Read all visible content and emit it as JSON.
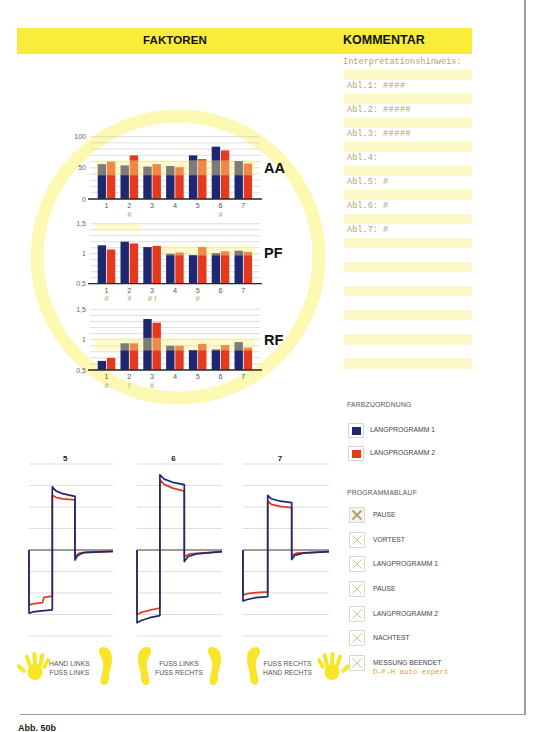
{
  "header": {
    "faktoren": "FAKTOREN",
    "kommentar": "KOMMENTAR",
    "accent_color": "#f9ec3a"
  },
  "kommentar": {
    "interpretation": "Interpretationshinweis:",
    "rows": [
      {
        "label": "Abl.1:",
        "value": "####"
      },
      {
        "label": "Abl.2:",
        "value": "#####"
      },
      {
        "label": "Abl.3:",
        "value": "#####"
      },
      {
        "label": "Abl.4:",
        "value": ""
      },
      {
        "label": "Abl.5:",
        "value": "#"
      },
      {
        "label": "Abl.6:",
        "value": "#"
      },
      {
        "label": "Abl.7:",
        "value": "#"
      }
    ]
  },
  "legend": {
    "title": "FARBZUORDNUNG",
    "items": [
      {
        "label": "LANGPROGRAMM 1",
        "color": "#1e2870"
      },
      {
        "label": "LANGPROGRAMM 2",
        "color": "#e5391e"
      }
    ]
  },
  "programmablauf": {
    "title": "PROGRAMMABLAUF",
    "items": [
      {
        "label": "PAUSE",
        "status": "active"
      },
      {
        "label": "VORTEST",
        "status": "pending"
      },
      {
        "label": "LANGPROGRAMM 1",
        "status": "pending"
      },
      {
        "label": "PAUSE",
        "status": "pending"
      },
      {
        "label": "LANGPROGRAMM 2",
        "status": "pending"
      },
      {
        "label": "NACHTEST",
        "status": "pending"
      },
      {
        "label": "MESSUNG BEENDET",
        "status": "pending"
      }
    ],
    "device": "D-F-H auto expert"
  },
  "electrode_positions": [
    {
      "line1": "HAND LINKS",
      "line2": "FUSS LINKS",
      "icons": [
        "hand-left",
        "foot"
      ]
    },
    {
      "line1": "FUSS LINKS",
      "line2": "FUSS RECHTS",
      "icons": [
        "foot",
        "foot"
      ]
    },
    {
      "line1": "FUSS RECHTS",
      "line2": "HAND RECHTS",
      "icons": [
        "foot",
        "hand-right"
      ]
    }
  ],
  "caption": "Abb. 50b",
  "chart_data": [
    {
      "type": "bar",
      "id": "AA",
      "title": "AA",
      "categories": [
        "1",
        "2",
        "3",
        "4",
        "5",
        "6",
        "7"
      ],
      "series": [
        {
          "name": "LANGPROGRAMM 1",
          "color": "#1e2870",
          "values": [
            56,
            54,
            52,
            53,
            70,
            84,
            61
          ]
        },
        {
          "name": "LANGPROGRAMM 2",
          "color": "#e5391e",
          "values": [
            60,
            70,
            56,
            51,
            64,
            78,
            57
          ]
        }
      ],
      "ylim": [
        0,
        100
      ],
      "yticks": [
        0,
        50,
        100
      ],
      "ytick_labels": [
        "0",
        "50",
        "100"
      ],
      "grid_step": 10,
      "grid": true,
      "reference_bands": [
        {
          "x": [
            0.5,
            7.5
          ],
          "y": [
            38,
            62
          ]
        }
      ],
      "annotations": {
        "2": "#",
        "6": "#"
      }
    },
    {
      "type": "bar",
      "id": "PF",
      "title": "PF",
      "categories": [
        "1",
        "2",
        "3",
        "4",
        "5",
        "6",
        "7"
      ],
      "series": [
        {
          "name": "LANGPROGRAMM 1",
          "color": "#1e2870",
          "values": [
            1.14,
            1.2,
            1.11,
            1.0,
            0.98,
            1.01,
            1.05
          ]
        },
        {
          "name": "LANGPROGRAMM 2",
          "color": "#e5391e",
          "values": [
            1.07,
            1.17,
            1.13,
            1.02,
            1.11,
            1.04,
            1.03
          ]
        }
      ],
      "ylim": [
        0.5,
        1.5
      ],
      "yticks": [
        0.5,
        1,
        1.5
      ],
      "ytick_labels": [
        "0,5",
        "1",
        "1,5"
      ],
      "grid_step": 0.1,
      "grid": true,
      "reference_bands": [
        {
          "x": [
            0.5,
            2.5
          ],
          "y": [
            1.37,
            1.5
          ]
        },
        {
          "x": [
            3.4,
            7.5
          ],
          "y": [
            0.97,
            1.14
          ]
        }
      ],
      "annotations": {
        "1": "#",
        "2": "#",
        "3": "# !",
        "5": "#"
      }
    },
    {
      "type": "bar",
      "id": "RF",
      "title": "RF",
      "categories": [
        "1",
        "2",
        "3",
        "4",
        "5",
        "6",
        "7"
      ],
      "series": [
        {
          "name": "LANGPROGRAMM 1",
          "color": "#1e2870",
          "values": [
            0.65,
            0.94,
            1.34,
            0.9,
            0.83,
            0.84,
            0.96
          ]
        },
        {
          "name": "LANGPROGRAMM 2",
          "color": "#e5391e",
          "values": [
            0.7,
            0.94,
            1.28,
            0.9,
            0.93,
            0.91,
            0.87
          ]
        }
      ],
      "ylim": [
        0.5,
        1.5
      ],
      "yticks": [
        0.5,
        1,
        1.5
      ],
      "ytick_labels": [
        "0,5",
        "1",
        "1,5"
      ],
      "grid_step": 0.1,
      "grid": true,
      "reference_bands": [
        {
          "x": [
            0.5,
            7.5
          ],
          "y": [
            0.82,
            1.03
          ]
        }
      ],
      "annotations": {
        "1": "#",
        "2": "!",
        "3": "#"
      }
    },
    {
      "type": "line",
      "id": "wave-5",
      "title": "5",
      "xlim": [
        0,
        1
      ],
      "ylim": [
        -4,
        4
      ],
      "grid": true,
      "series": [
        {
          "name": "LANGPROGRAMM 2",
          "color": "#e5391e",
          "points": [
            [
              0,
              0
            ],
            [
              0,
              -2.55
            ],
            [
              0.05,
              -2.5
            ],
            [
              0.16,
              -2.45
            ],
            [
              0.18,
              -2.2
            ],
            [
              0.277,
              -2.15
            ],
            [
              0.277,
              2.55
            ],
            [
              0.32,
              2.45
            ],
            [
              0.4,
              2.38
            ],
            [
              0.548,
              2.33
            ],
            [
              0.548,
              -0.3
            ],
            [
              0.6,
              -0.15
            ],
            [
              0.7,
              -0.1
            ],
            [
              1,
              -0.06
            ]
          ]
        },
        {
          "name": "LANGPROGRAMM 1",
          "color": "#1e2870",
          "points": [
            [
              0,
              0
            ],
            [
              0,
              -2.94
            ],
            [
              0.05,
              -2.88
            ],
            [
              0.12,
              -2.84
            ],
            [
              0.277,
              -2.78
            ],
            [
              0.277,
              2.94
            ],
            [
              0.32,
              2.75
            ],
            [
              0.4,
              2.62
            ],
            [
              0.548,
              2.5
            ],
            [
              0.548,
              -0.47
            ],
            [
              0.58,
              -0.25
            ],
            [
              0.65,
              -0.12
            ],
            [
              1,
              -0.06
            ]
          ]
        }
      ]
    },
    {
      "type": "line",
      "id": "wave-6",
      "title": "6",
      "xlim": [
        0,
        1
      ],
      "ylim": [
        -4,
        4
      ],
      "grid": true,
      "series": [
        {
          "name": "LANGPROGRAMM 2",
          "color": "#e5391e",
          "points": [
            [
              0,
              0
            ],
            [
              0,
              -3.0
            ],
            [
              0.05,
              -2.9
            ],
            [
              0.15,
              -2.8
            ],
            [
              0.27,
              -2.7
            ],
            [
              0.27,
              3.26
            ],
            [
              0.32,
              3.05
            ],
            [
              0.42,
              2.88
            ],
            [
              0.556,
              2.74
            ],
            [
              0.556,
              -0.3
            ],
            [
              0.62,
              -0.18
            ],
            [
              1,
              -0.08
            ]
          ]
        },
        {
          "name": "LANGPROGRAMM 1",
          "color": "#1e2870",
          "points": [
            [
              0,
              0
            ],
            [
              0,
              -3.38
            ],
            [
              0.05,
              -3.28
            ],
            [
              0.15,
              -3.15
            ],
            [
              0.27,
              -3.05
            ],
            [
              0.27,
              3.5
            ],
            [
              0.32,
              3.3
            ],
            [
              0.42,
              3.15
            ],
            [
              0.556,
              3.04
            ],
            [
              0.556,
              -0.54
            ],
            [
              0.6,
              -0.3
            ],
            [
              0.7,
              -0.18
            ],
            [
              1,
              -0.08
            ]
          ]
        }
      ]
    },
    {
      "type": "line",
      "id": "wave-7",
      "title": "7",
      "xlim": [
        0,
        1
      ],
      "ylim": [
        -4,
        4
      ],
      "grid": true,
      "series": [
        {
          "name": "LANGPROGRAMM 2",
          "color": "#e5391e",
          "points": [
            [
              0,
              0
            ],
            [
              0,
              -2.1
            ],
            [
              0.05,
              -2.03
            ],
            [
              0.15,
              -1.98
            ],
            [
              0.287,
              -1.95
            ],
            [
              0.287,
              2.28
            ],
            [
              0.33,
              2.12
            ],
            [
              0.43,
              2.03
            ],
            [
              0.566,
              1.97
            ],
            [
              0.566,
              -0.25
            ],
            [
              0.62,
              -0.15
            ],
            [
              1,
              -0.08
            ]
          ]
        },
        {
          "name": "LANGPROGRAMM 1",
          "color": "#1e2870",
          "points": [
            [
              0,
              0
            ],
            [
              0,
              -2.37
            ],
            [
              0.05,
              -2.3
            ],
            [
              0.15,
              -2.22
            ],
            [
              0.287,
              -2.17
            ],
            [
              0.287,
              2.54
            ],
            [
              0.33,
              2.38
            ],
            [
              0.43,
              2.27
            ],
            [
              0.566,
              2.2
            ],
            [
              0.566,
              -0.44
            ],
            [
              0.6,
              -0.25
            ],
            [
              0.7,
              -0.15
            ],
            [
              1,
              -0.08
            ]
          ]
        }
      ]
    }
  ]
}
